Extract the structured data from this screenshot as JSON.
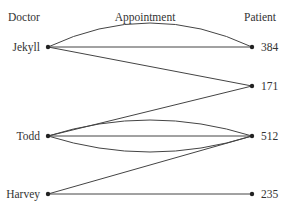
{
  "headers": {
    "left": "Doctor",
    "middle": "Appointment",
    "right": "Patient"
  },
  "colors": {
    "edge": "#444444",
    "node": "#222222",
    "text": "#333333"
  },
  "left_nodes": [
    {
      "id": "jekyll",
      "label": "Jekyll",
      "x": 48,
      "y": 47
    },
    {
      "id": "todd",
      "label": "Todd",
      "x": 48,
      "y": 136
    },
    {
      "id": "harvey",
      "label": "Harvey",
      "x": 48,
      "y": 194
    }
  ],
  "right_nodes": [
    {
      "id": "p384",
      "label": "384",
      "x": 252,
      "y": 47
    },
    {
      "id": "p171",
      "label": "171",
      "x": 252,
      "y": 86
    },
    {
      "id": "p512",
      "label": "512",
      "x": 252,
      "y": 136
    },
    {
      "id": "p235",
      "label": "235",
      "x": 252,
      "y": 194
    }
  ],
  "edges": [
    {
      "from": "jekyll",
      "to": "p384",
      "bend": -24
    },
    {
      "from": "jekyll",
      "to": "p384",
      "bend": 0
    },
    {
      "from": "jekyll",
      "to": "p171",
      "bend": 0
    },
    {
      "from": "todd",
      "to": "p171",
      "bend": 0
    },
    {
      "from": "todd",
      "to": "p512",
      "bend": -16
    },
    {
      "from": "todd",
      "to": "p512",
      "bend": 0
    },
    {
      "from": "todd",
      "to": "p512",
      "bend": 16
    },
    {
      "from": "harvey",
      "to": "p512",
      "bend": 0
    },
    {
      "from": "harvey",
      "to": "p235",
      "bend": 0
    }
  ]
}
